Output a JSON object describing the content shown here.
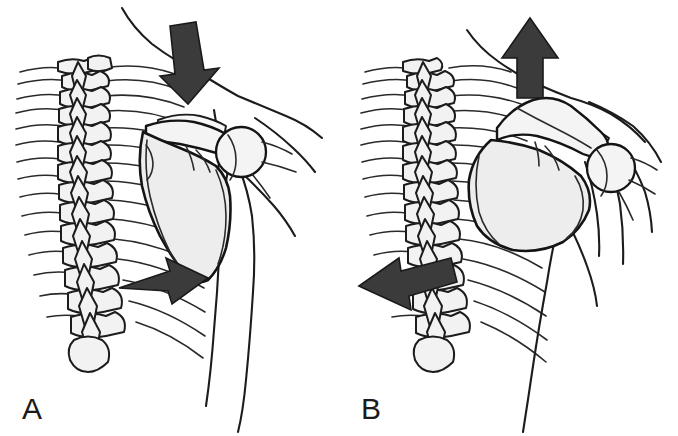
{
  "figure": {
    "background_color": "#ffffff",
    "width": 678,
    "height": 436,
    "style": "black and white line drawing, medical illustration"
  },
  "panels": [
    {
      "id": "A",
      "label": "A",
      "description": "Posterior view of thorax, spine, ribs, scapula and proximal humerus with downward force arrow at the superior shoulder and a rightward arrow at the inferior scapular angle over the ribs",
      "arrows": [
        {
          "name": "shoulder-depression-arrow",
          "direction": "down",
          "color": "#3b3b3b",
          "position": "superior shoulder / trapezius region"
        },
        {
          "name": "inferior-angle-arrow",
          "direction": "right",
          "color": "#3b3b3b",
          "position": "inferior angle of scapula over posterior ribs"
        }
      ],
      "anatomy": [
        "thoracic vertebrae",
        "spinous processes",
        "transverse processes",
        "posterior ribs",
        "scapula",
        "spine of scapula",
        "acromion",
        "humeral head",
        "clavicle",
        "body outline"
      ]
    },
    {
      "id": "B",
      "label": "B",
      "description": "Posterior view of thorax with scapula elevated and upwardly rotated, upward force arrow at the superior shoulder and a leftward arrow at the inferior scapular angle toward the spine",
      "arrows": [
        {
          "name": "shoulder-elevation-arrow",
          "direction": "up",
          "color": "#3b3b3b",
          "position": "superior shoulder / trapezius region"
        },
        {
          "name": "inferior-angle-arrow",
          "direction": "left",
          "color": "#3b3b3b",
          "position": "inferior angle of scapula pointing medially toward spine"
        }
      ],
      "anatomy": [
        "thoracic vertebrae",
        "spinous processes",
        "transverse processes",
        "posterior ribs",
        "scapula",
        "spine of scapula",
        "acromion",
        "humeral head",
        "clavicle",
        "body outline"
      ]
    }
  ],
  "colors": {
    "line": "#1c1c1c",
    "arrow_fill": "#3b3b3b",
    "bone_fill": "#f2f2f2",
    "scapula_fill": "#ededed",
    "background": "#ffffff",
    "label_text": "#1a1a1a"
  }
}
